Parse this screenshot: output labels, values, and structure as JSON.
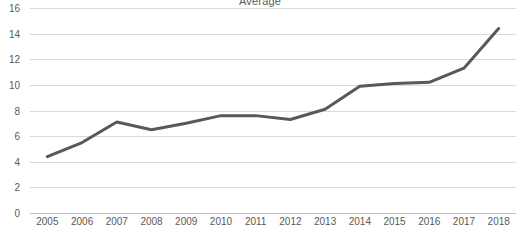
{
  "chart_data": {
    "type": "line",
    "title": "Average",
    "xlabel": "",
    "ylabel": "",
    "categories": [
      "2005",
      "2006",
      "2007",
      "2008",
      "2009",
      "2010",
      "2011",
      "2012",
      "2013",
      "2014",
      "2015",
      "2016",
      "2017",
      "2018"
    ],
    "values": [
      4.4,
      5.5,
      7.1,
      6.5,
      7.0,
      7.6,
      7.6,
      7.3,
      8.1,
      9.9,
      10.1,
      10.2,
      11.3,
      14.4
    ],
    "series": [
      {
        "name": "Average",
        "values": [
          4.4,
          5.5,
          7.1,
          6.5,
          7.0,
          7.6,
          7.6,
          7.3,
          8.1,
          9.9,
          10.1,
          10.2,
          11.3,
          14.4
        ],
        "color": "#595959"
      }
    ],
    "ylim": [
      0,
      16
    ],
    "yticks": [
      0,
      2,
      4,
      6,
      8,
      10,
      12,
      14,
      16
    ],
    "ytick_labels": [
      "0",
      "2",
      "4",
      "6",
      "8",
      "10",
      "12",
      "14",
      "16"
    ],
    "xtick_labels": [
      "2005",
      "2006",
      "2007",
      "2008",
      "2009",
      "2010",
      "2011",
      "2012",
      "2013",
      "2014",
      "2015",
      "2016",
      "2017",
      "2018"
    ],
    "grid": true,
    "grid_color": "#d9d9d9",
    "axis_color": "#bfbfbf",
    "legend": false,
    "legend_position": "none",
    "line_color": "#595959",
    "line_width": 3,
    "markers": false,
    "background": "#ffffff",
    "text_color": "#595959"
  }
}
